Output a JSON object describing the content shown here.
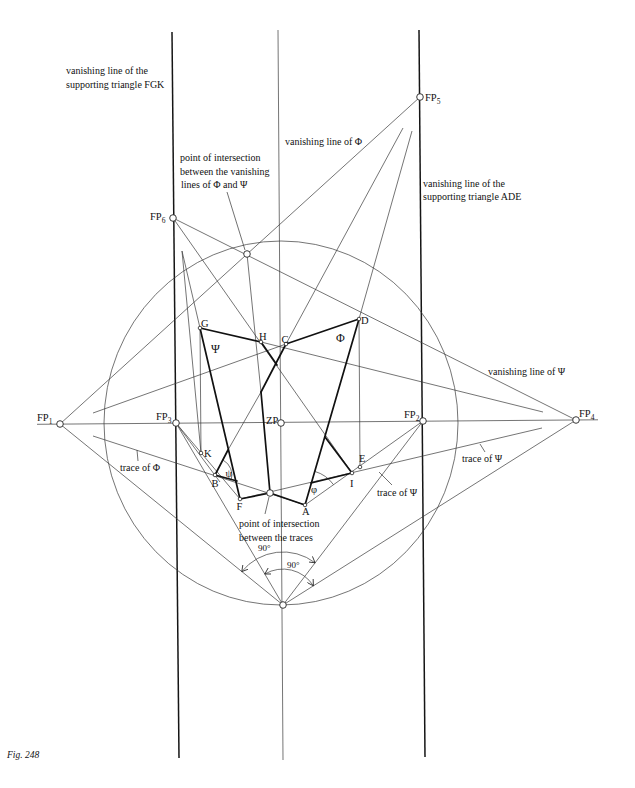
{
  "figure": {
    "caption": "Fig. 248"
  },
  "annotations": {
    "vanishing_line_fgk": [
      "vanishing line of the",
      "supporting triangle FGK"
    ],
    "vanishing_line_ade": [
      "vanishing line of the",
      "supporting triangle ADE"
    ],
    "vanishing_line_phi": "vanishing line of Φ",
    "vanishing_line_psi": "vanishing line of Ψ",
    "intersection_of_vanishing_lines": [
      "point of intersection",
      "between the vanishing",
      "lines of Φ and Ψ"
    ],
    "intersection_of_traces": [
      "point of intersection",
      "between the traces"
    ],
    "trace_phi": "trace of Φ",
    "trace_psi_right": "trace of Ψ",
    "trace_psi_lower": "trace of Ψ",
    "right_angle_outer": "90°",
    "right_angle_inner": "90°"
  },
  "vanishing_points": {
    "fp1": {
      "main": "FP",
      "sub": "1"
    },
    "fp2": {
      "main": "FP",
      "sub": "2"
    },
    "fp3": {
      "main": "FP",
      "sub": "3"
    },
    "fp4": {
      "main": "FP",
      "sub": "4"
    },
    "fp5": {
      "main": "FP",
      "sub": "5"
    },
    "fp6": {
      "main": "FP",
      "sub": "6"
    },
    "zp": "ZP"
  },
  "points": {
    "A": "A",
    "B": "B",
    "C": "C",
    "D": "D",
    "E": "E",
    "F": "F",
    "G": "G",
    "H": "H",
    "I": "I",
    "K": "K"
  },
  "planes": {
    "phi": "Φ",
    "psi": "Ψ"
  },
  "angles": {
    "phi": "φ",
    "psi": "ψ"
  }
}
